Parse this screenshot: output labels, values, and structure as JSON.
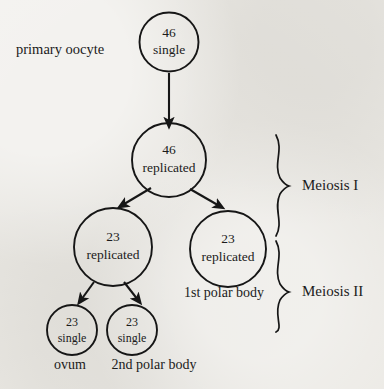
{
  "diagram": {
    "background_color": "#eceae5",
    "ink_color": "#161616",
    "nodes": [
      {
        "id": "primary-oocyte",
        "line1": "46",
        "line2": "single",
        "cx": 169,
        "cy": 42,
        "r": 29.5,
        "font_size": 13.5
      },
      {
        "id": "primary-oocyte-replicated",
        "line1": "46",
        "line2": "replicated",
        "cx": 169,
        "cy": 160,
        "r": 37,
        "font_size": 13.5
      },
      {
        "id": "secondary-oocyte",
        "line1": "23",
        "line2": "replicated",
        "cx": 113,
        "cy": 247,
        "r": 39,
        "font_size": 13.5
      },
      {
        "id": "first-polar-body",
        "line1": "23",
        "line2": "replicated",
        "cx": 228,
        "cy": 249,
        "r": 38,
        "font_size": 13.5
      },
      {
        "id": "ovum",
        "line1": "23",
        "line2": "single",
        "cx": 72,
        "cy": 330,
        "r": 25,
        "font_size": 12
      },
      {
        "id": "second-polar-body",
        "line1": "23",
        "line2": "single",
        "cx": 132,
        "cy": 330,
        "r": 25,
        "font_size": 12
      }
    ],
    "labels": [
      {
        "id": "primary-oocyte-label",
        "text": "primary oocyte",
        "x": 16,
        "y": 54,
        "font_size": 14.5,
        "anchor": "start"
      },
      {
        "id": "first-polar-body-label",
        "text": "1st polar body",
        "x": 184,
        "y": 297,
        "font_size": 14,
        "anchor": "start"
      },
      {
        "id": "ovum-label",
        "text": "ovum",
        "x": 70,
        "y": 369,
        "font_size": 14,
        "anchor": "middle"
      },
      {
        "id": "second-polar-body-label",
        "text": "2nd polar body",
        "x": 154,
        "y": 369,
        "font_size": 14,
        "anchor": "middle"
      },
      {
        "id": "meiosis-one-label",
        "text": "Meiosis I",
        "x": 302,
        "y": 190,
        "font_size": 15,
        "anchor": "start"
      },
      {
        "id": "meiosis-two-label",
        "text": "Meiosis II",
        "x": 302,
        "y": 296,
        "font_size": 15,
        "anchor": "start"
      }
    ],
    "arrows": [
      {
        "id": "arrow-primary-to-replicated",
        "x1": 169,
        "y1": 73,
        "x2": 169,
        "y2": 124
      },
      {
        "id": "arrow-replicated-to-secondary-oocyte",
        "x1": 151,
        "y1": 188,
        "x2": 121,
        "y2": 206
      },
      {
        "id": "arrow-replicated-to-first-polar-body",
        "x1": 190,
        "y1": 189,
        "x2": 221,
        "y2": 207
      },
      {
        "id": "arrow-secondary-to-ovum",
        "x1": 94,
        "y1": 282,
        "x2": 80,
        "y2": 302
      },
      {
        "id": "arrow-secondary-to-second-polar-body",
        "x1": 124,
        "y1": 282,
        "x2": 139,
        "y2": 302
      }
    ],
    "braces": [
      {
        "id": "brace-meiosis-one",
        "x": 281,
        "y_top": 135,
        "y_bottom": 236
      },
      {
        "id": "brace-meiosis-two",
        "x": 281,
        "y_top": 241,
        "y_bottom": 332
      }
    ]
  }
}
